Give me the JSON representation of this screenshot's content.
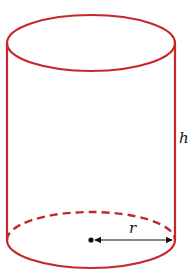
{
  "diagram": {
    "labels": {
      "height": "h",
      "radius": "r"
    },
    "colors": {
      "outline": "#c8272a",
      "arrow": "#111111"
    }
  }
}
